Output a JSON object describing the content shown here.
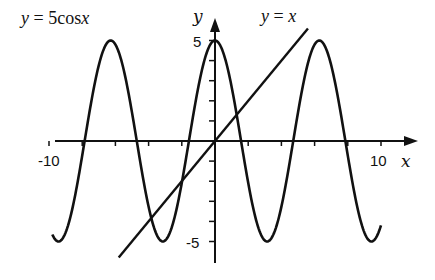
{
  "chart_data": {
    "type": "line",
    "title": "",
    "xlabel": "x",
    "ylabel": "y",
    "xlim": [
      -10,
      10
    ],
    "ylim": [
      -6,
      6
    ],
    "x_ticks_step": 2,
    "y_ticks_step": 1,
    "tick_labels": {
      "x": [
        "-10",
        "10"
      ],
      "y": [
        "5",
        "-5"
      ]
    },
    "grid": false,
    "legend": "inline annotations",
    "series": [
      {
        "name": "y = 5cos x",
        "expression": "5*cos(x)",
        "domain": [
          -9.8,
          10
        ],
        "annotation": "y = 5cos x",
        "annotation_position": "top-left"
      },
      {
        "name": "y = x",
        "expression": "x",
        "domain": [
          -5.8,
          5.6
        ],
        "annotation": "y = x",
        "annotation_position": "top-right of line end"
      }
    ],
    "intersections_approx": [
      {
        "x": -3.8,
        "y": -3.8
      },
      {
        "x": -2.0,
        "y": -2.0
      },
      {
        "x": 1.3,
        "y": 1.3
      }
    ]
  },
  "labels": {
    "cos_label_y": "y",
    "cos_label_eq": " = 5cos",
    "cos_label_x": "x",
    "line_label_y": "y",
    "line_label_eq": " = ",
    "line_label_x": "x",
    "x_axis_label": "x",
    "y_axis_label": "y",
    "x_min_tick": "-10",
    "x_max_tick": "10",
    "y_max_tick": "5",
    "y_min_tick": "-5"
  },
  "colors": {
    "curve": "#111111",
    "axis": "#111111",
    "background": "#ffffff"
  }
}
